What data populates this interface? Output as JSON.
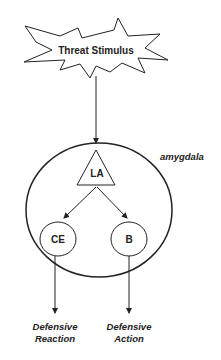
{
  "stimulus": {
    "label": "Threat Stimulus"
  },
  "region": {
    "label": "amygdala"
  },
  "nodes": {
    "la": {
      "label": "LA"
    },
    "ce": {
      "label": "CE"
    },
    "b": {
      "label": "B"
    }
  },
  "outputs": {
    "ce": {
      "line1": "Defensive",
      "line2": "Reaction"
    },
    "b": {
      "line1": "Defensive",
      "line2": "Action"
    }
  },
  "colors": {
    "stroke": "#222222",
    "background": "#ffffff"
  }
}
